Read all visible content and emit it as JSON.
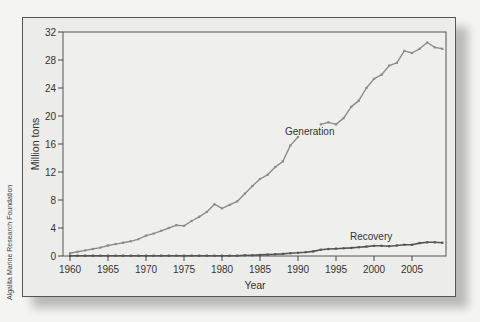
{
  "chart_data": {
    "type": "line",
    "title": "",
    "xlabel": "Year",
    "ylabel": "Million tons",
    "xlim": [
      1959,
      2009.5
    ],
    "ylim": [
      0,
      32
    ],
    "grid": false,
    "x_ticks": [
      1960,
      1965,
      1970,
      1975,
      1980,
      1985,
      1990,
      1995,
      2000,
      2005
    ],
    "y_ticks": [
      0,
      4,
      8,
      12,
      16,
      20,
      24,
      28,
      32
    ],
    "legend_position": "inline labels",
    "annotations": [
      {
        "text": "Generation",
        "x": 1993,
        "y": 17.8
      },
      {
        "text": "Recovery",
        "x": 2000,
        "y": 2.6
      }
    ],
    "credit": "Algalita Marine Research Foundation",
    "series": [
      {
        "name": "Generation",
        "color": "#8c8c8c",
        "segments": [
          {
            "x": [
              1960,
              1961,
              1962,
              1963,
              1964,
              1965,
              1966,
              1967,
              1968,
              1969,
              1970,
              1971,
              1972,
              1973,
              1974,
              1975,
              1976,
              1977,
              1978,
              1979,
              1980,
              1981,
              1982,
              1983,
              1984,
              1985,
              1986,
              1987,
              1988,
              1989,
              1990
            ],
            "y": [
              0.4,
              0.6,
              0.8,
              1.0,
              1.2,
              1.5,
              1.7,
              1.9,
              2.1,
              2.4,
              2.9,
              3.2,
              3.6,
              4.0,
              4.4,
              4.3,
              5.0,
              5.6,
              6.3,
              7.4,
              6.8,
              7.3,
              7.8,
              8.9,
              10.0,
              11.0,
              11.6,
              12.7,
              13.5,
              15.8,
              17.0
            ]
          },
          {
            "x": [
              1993,
              1994,
              1995,
              1996,
              1997,
              1998,
              1999,
              2000,
              2001,
              2002,
              2003,
              2004,
              2005,
              2006,
              2007,
              2008,
              2009
            ],
            "y": [
              18.8,
              19.1,
              18.8,
              19.7,
              21.3,
              22.2,
              24.0,
              25.3,
              25.9,
              27.2,
              27.6,
              29.3,
              29.0,
              29.6,
              30.5,
              29.8,
              29.6
            ]
          }
        ]
      },
      {
        "name": "Recovery",
        "color": "#555555",
        "segments": [
          {
            "x": [
              1960,
              1961,
              1962,
              1963,
              1964,
              1965,
              1966,
              1967,
              1968,
              1969,
              1970,
              1971,
              1972,
              1973,
              1974,
              1975,
              1976,
              1977,
              1978,
              1979,
              1980,
              1981,
              1982,
              1983,
              1984,
              1985,
              1986,
              1987,
              1988,
              1989,
              1990,
              1991,
              1992,
              1993,
              1994,
              1995,
              1996,
              1997,
              1998,
              1999,
              2000,
              2001,
              2002,
              2003,
              2004,
              2005,
              2006,
              2007,
              2008,
              2009
            ],
            "y": [
              0.05,
              0.05,
              0.05,
              0.05,
              0.05,
              0.05,
              0.05,
              0.05,
              0.05,
              0.05,
              0.05,
              0.05,
              0.05,
              0.05,
              0.05,
              0.05,
              0.05,
              0.05,
              0.05,
              0.05,
              0.05,
              0.05,
              0.05,
              0.1,
              0.1,
              0.15,
              0.2,
              0.25,
              0.3,
              0.4,
              0.45,
              0.55,
              0.65,
              0.9,
              1.0,
              1.05,
              1.1,
              1.15,
              1.25,
              1.35,
              1.45,
              1.45,
              1.4,
              1.5,
              1.6,
              1.6,
              1.85,
              1.95,
              1.95,
              1.9
            ]
          }
        ]
      }
    ]
  }
}
